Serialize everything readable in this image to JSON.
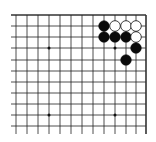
{
  "board": {
    "description": "Go board corner fragment (top-right), diagram",
    "line_color": "#222222",
    "border_color": "#333333",
    "background": "#ffffff",
    "grid": {
      "x_lines": [
        16,
        27,
        38,
        49,
        60,
        71,
        82,
        93,
        104,
        115,
        126,
        136,
        146
      ],
      "y_lines": [
        15,
        26,
        37,
        48,
        60,
        71,
        82,
        93,
        104,
        115,
        126
      ],
      "h_start": 11,
      "v_end": 134,
      "top_edge_y": 15,
      "right_edge_x": 146
    },
    "star_points": [
      [
        49,
        48
      ],
      [
        115,
        48
      ],
      [
        49,
        115
      ],
      [
        115,
        115
      ]
    ],
    "stones": [
      {
        "color": "black",
        "x": 104,
        "y": 26
      },
      {
        "color": "white",
        "x": 115,
        "y": 26
      },
      {
        "color": "white",
        "x": 126,
        "y": 26
      },
      {
        "color": "white",
        "x": 136,
        "y": 26
      },
      {
        "color": "black",
        "x": 104,
        "y": 37
      },
      {
        "color": "black",
        "x": 115,
        "y": 37
      },
      {
        "color": "black",
        "x": 126,
        "y": 37
      },
      {
        "color": "white",
        "x": 136,
        "y": 37
      },
      {
        "color": "black",
        "x": 136,
        "y": 48
      },
      {
        "color": "black",
        "x": 126,
        "y": 60
      }
    ],
    "stone_radius": 5.3
  }
}
